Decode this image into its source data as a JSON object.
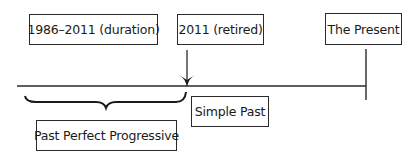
{
  "diagram": {
    "type": "timeline",
    "top_labels": [
      {
        "id": "duration",
        "text": "1986–2011 (duration)"
      },
      {
        "id": "retired",
        "text": "2011 (retired)"
      },
      {
        "id": "present",
        "text": "The Present"
      }
    ],
    "bottom_labels": [
      {
        "id": "simple_past",
        "text": "Simple Past"
      },
      {
        "id": "past_perfect_progressive",
        "text": "Past Perfect Progressive"
      }
    ],
    "colors": {
      "line": "#2a2a2a",
      "background": "#ffffff"
    }
  }
}
